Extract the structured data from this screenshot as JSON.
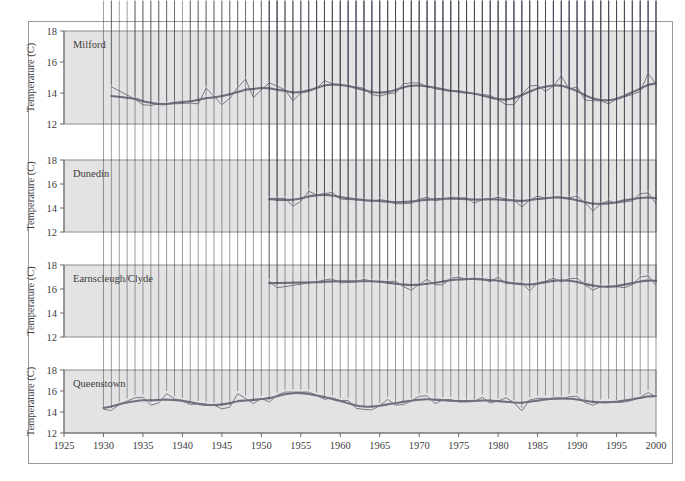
{
  "figure": {
    "ylabel": "Temperature (C)",
    "y_ticks": [
      "12",
      "14",
      "16",
      "18"
    ],
    "x_ticks": [
      "1925",
      "1930",
      "1935",
      "1940",
      "1945",
      "1950",
      "1955",
      "1960",
      "1965",
      "1970",
      "1975",
      "1980",
      "1985",
      "1990",
      "1995",
      "2000"
    ],
    "panel_bg": "#e3e3e3",
    "marker_color": "#3a3a4a",
    "line_color": "#6f6f7d",
    "smooth_color": "#6f6f7d",
    "frame_color": "#9a9a9a"
  },
  "chart_data": {
    "type": "line",
    "title": "",
    "xlabel": "",
    "ylabel": "Temperature (C)",
    "xlim": [
      1925,
      2000
    ],
    "ylim": [
      12,
      18
    ],
    "grid": false,
    "legend": "none",
    "y_ticks": [
      12,
      14,
      16,
      18
    ],
    "x_ticks": [
      1925,
      1930,
      1935,
      1940,
      1945,
      1950,
      1955,
      1960,
      1965,
      1970,
      1975,
      1980,
      1985,
      1990,
      1995,
      2000
    ],
    "panels": [
      {
        "name": "Milford",
        "label": "Milford",
        "series": [
          {
            "name": "Annual mean temperature",
            "x": [
              1931,
              1934,
              1935,
              1936,
              1937,
              1938,
              1939,
              1941,
              1942,
              1943,
              1944,
              1945,
              1946,
              1947,
              1948,
              1949,
              1950,
              1951,
              1952,
              1953,
              1954,
              1955,
              1956,
              1957,
              1958,
              1959,
              1960,
              1961,
              1962,
              1963,
              1964,
              1965,
              1966,
              1967,
              1968,
              1969,
              1970,
              1971,
              1972,
              1973,
              1974,
              1975,
              1976,
              1977,
              1978,
              1979,
              1980,
              1981,
              1982,
              1983,
              1984,
              1985,
              1986,
              1987,
              1988,
              1989,
              1990,
              1991,
              1992,
              1993,
              1994,
              1995,
              1996,
              1997,
              1998,
              1999,
              2000
            ],
            "y": [
              14.4,
              13.6,
              13.25,
              13.2,
              13.3,
              13.3,
              13.3,
              13.35,
              13.3,
              14.3,
              13.8,
              13.25,
              13.65,
              14.35,
              14.9,
              13.7,
              14.2,
              14.65,
              14.45,
              14.2,
              13.5,
              14.0,
              14.1,
              14.3,
              14.8,
              14.6,
              14.55,
              14.45,
              14.4,
              14.3,
              13.9,
              13.8,
              13.95,
              14.0,
              14.6,
              14.65,
              14.65,
              14.4,
              14.3,
              14.2,
              14.1,
              14.15,
              14.0,
              13.95,
              13.9,
              13.85,
              13.55,
              13.25,
              13.25,
              13.9,
              14.45,
              14.5,
              14.1,
              14.45,
              15.1,
              14.25,
              14.4,
              13.55,
              13.5,
              13.5,
              13.3,
              13.6,
              13.75,
              13.9,
              14.1,
              15.25,
              14.6
            ]
          }
        ]
      },
      {
        "name": "Dunedin",
        "label": "Dunedin",
        "series": [
          {
            "name": "Annual mean temperature",
            "x": [
              1951,
              1952,
              1953,
              1954,
              1955,
              1956,
              1957,
              1958,
              1959,
              1960,
              1961,
              1962,
              1963,
              1964,
              1965,
              1966,
              1967,
              1968,
              1969,
              1970,
              1971,
              1972,
              1973,
              1974,
              1975,
              1976,
              1977,
              1978,
              1979,
              1980,
              1981,
              1982,
              1983,
              1984,
              1985,
              1986,
              1987,
              1988,
              1989,
              1990,
              1991,
              1992,
              1993,
              1994,
              1995,
              1996,
              1997,
              1998,
              1999,
              2000
            ],
            "y": [
              14.8,
              14.8,
              14.8,
              14.15,
              14.55,
              15.4,
              15.1,
              15.2,
              15.3,
              14.75,
              14.7,
              14.7,
              14.65,
              14.55,
              14.7,
              14.6,
              14.35,
              14.35,
              14.4,
              14.75,
              14.9,
              14.6,
              14.7,
              14.9,
              14.85,
              14.85,
              14.4,
              14.7,
              14.75,
              14.9,
              14.75,
              14.65,
              14.1,
              14.65,
              15.0,
              14.8,
              14.9,
              14.9,
              14.85,
              15.0,
              14.45,
              13.75,
              14.35,
              14.6,
              14.4,
              14.5,
              14.6,
              15.2,
              15.25,
              14.35
            ]
          }
        ]
      },
      {
        "name": "Earnscleugh/Clyde",
        "label": "Earnscleugh/Clyde",
        "series": [
          {
            "name": "Annual mean temperature",
            "x": [
              1951,
              1952,
              1957,
              1958,
              1959,
              1960,
              1961,
              1962,
              1963,
              1964,
              1965,
              1966,
              1967,
              1968,
              1969,
              1970,
              1971,
              1972,
              1973,
              1974,
              1975,
              1976,
              1977,
              1978,
              1979,
              1980,
              1981,
              1982,
              1983,
              1984,
              1985,
              1986,
              1987,
              1988,
              1989,
              1990,
              1991,
              1992,
              1993,
              1994,
              1995,
              1996,
              1997,
              1998,
              1999,
              2000
            ],
            "y": [
              16.65,
              16.1,
              16.6,
              16.75,
              16.85,
              16.5,
              16.55,
              16.6,
              16.8,
              16.65,
              16.6,
              16.6,
              16.65,
              16.2,
              15.9,
              16.4,
              16.8,
              16.35,
              16.35,
              16.9,
              17.0,
              16.8,
              16.85,
              16.85,
              16.6,
              17.0,
              16.45,
              16.45,
              16.5,
              15.85,
              16.5,
              16.65,
              16.9,
              16.6,
              16.85,
              16.9,
              16.35,
              15.9,
              16.2,
              16.25,
              16.2,
              16.1,
              16.35,
              17.0,
              17.1,
              16.3
            ]
          }
        ]
      },
      {
        "name": "Queenstown",
        "label": "Queenstown",
        "series": [
          {
            "name": "Annual mean temperature",
            "x": [
              1930,
              1931,
              1932,
              1933,
              1934,
              1935,
              1936,
              1937,
              1938,
              1939,
              1940,
              1941,
              1942,
              1943,
              1944,
              1945,
              1946,
              1947,
              1948,
              1949,
              1950,
              1951,
              1952,
              1953,
              1954,
              1955,
              1956,
              1957,
              1958,
              1959,
              1960,
              1961,
              1962,
              1963,
              1964,
              1965,
              1966,
              1967,
              1968,
              1969,
              1970,
              1971,
              1972,
              1973,
              1974,
              1975,
              1976,
              1977,
              1978,
              1979,
              1980,
              1981,
              1982,
              1983,
              1984,
              1985,
              1986,
              1987,
              1988,
              1989,
              1990,
              1991,
              1992,
              1993,
              1994,
              1995,
              1996,
              1997,
              1998,
              1999,
              2000
            ],
            "y": [
              14.25,
              14.15,
              14.7,
              15.05,
              15.35,
              15.4,
              14.65,
              14.85,
              15.75,
              15.25,
              15.1,
              14.7,
              14.8,
              14.75,
              14.65,
              14.3,
              14.45,
              15.75,
              15.3,
              14.8,
              15.3,
              14.95,
              15.6,
              15.9,
              15.9,
              15.9,
              15.9,
              15.6,
              15.2,
              15.35,
              15.1,
              15.1,
              14.35,
              14.25,
              14.2,
              14.6,
              15.2,
              14.65,
              14.7,
              15.05,
              15.5,
              15.55,
              14.8,
              15.15,
              15.2,
              14.95,
              14.95,
              15.0,
              15.4,
              14.85,
              15.05,
              15.35,
              14.9,
              14.1,
              15.15,
              15.3,
              15.3,
              15.2,
              15.25,
              15.45,
              15.5,
              14.9,
              14.65,
              14.95,
              15.0,
              14.9,
              14.95,
              15.1,
              15.4,
              15.85,
              15.45
            ]
          }
        ]
      }
    ]
  }
}
